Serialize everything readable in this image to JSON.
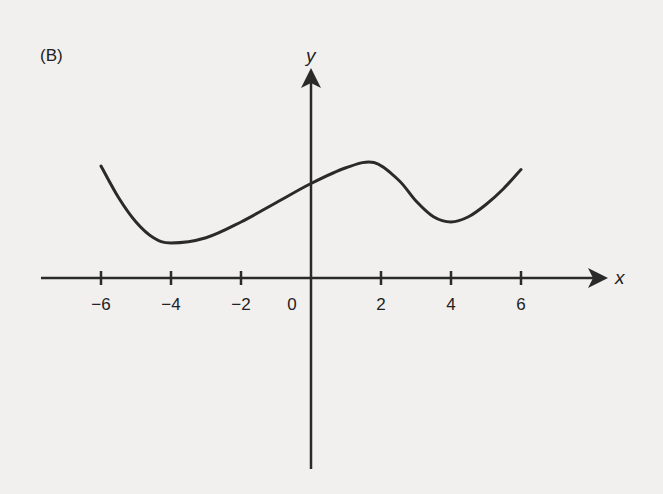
{
  "panel_label": "(B)",
  "chart_data": {
    "type": "line",
    "title": "(B)",
    "xlabel": "x",
    "ylabel": "y",
    "xticks": [
      -6,
      -4,
      -2,
      0,
      2,
      4,
      6
    ],
    "xtick_labels": [
      "-6",
      "-4",
      "-2",
      "0",
      "2",
      "4",
      "6"
    ],
    "xlim": [
      -7.8,
      8.4
    ],
    "ylim": [
      -5.5,
      6.0
    ],
    "grid": false,
    "legend": null,
    "series": [
      {
        "name": "f(x)",
        "x": [
          -6,
          -5.5,
          -5,
          -4.5,
          -4,
          -3,
          -2,
          -1,
          0,
          1,
          1.8,
          2.5,
          3,
          3.5,
          4,
          4.5,
          5,
          5.5,
          6
        ],
        "y": [
          3.2,
          2.3,
          1.6,
          1.15,
          1.0,
          1.15,
          1.6,
          2.15,
          2.7,
          3.15,
          3.3,
          2.8,
          2.2,
          1.75,
          1.6,
          1.75,
          2.1,
          2.55,
          3.1
        ]
      }
    ],
    "annotations": [
      {
        "text": "(B)",
        "position": "top-left"
      }
    ],
    "features": {
      "local_min_1": {
        "x": -4,
        "y": 1.0
      },
      "y_intercept": {
        "x": 0,
        "y": 2.7
      },
      "local_max": {
        "x": 1.8,
        "y": 3.3
      },
      "local_min_2": {
        "x": 4,
        "y": 1.6
      },
      "endpoints": [
        {
          "x": -6,
          "y": 3.2
        },
        {
          "x": 6,
          "y": 3.1
        }
      ]
    }
  },
  "colors": {
    "background": "#f1f0ee",
    "ink": "#2a2a2a"
  }
}
